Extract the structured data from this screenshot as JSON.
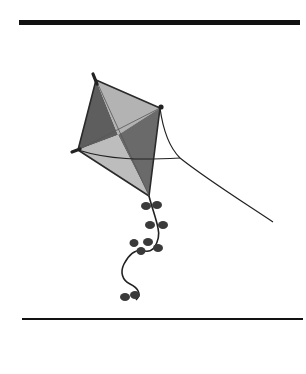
{
  "illustration": {
    "subject": "kite",
    "colors": {
      "rule": "#111111",
      "kite_light": "#b8b8b8",
      "kite_mid": "#8a8a8a",
      "kite_dark": "#5e5e5e",
      "outline": "#2a2a2a",
      "string": "#222222",
      "bow": "#3a3a3a"
    }
  }
}
